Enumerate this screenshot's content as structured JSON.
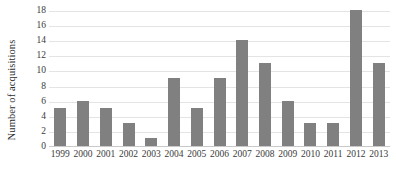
{
  "chart_data": {
    "type": "bar",
    "title": "",
    "subtitle": "",
    "xlabel": "",
    "ylabel": "Number of acquisitions",
    "categories": [
      "1999",
      "2000",
      "2001",
      "2002",
      "2003",
      "2004",
      "2005",
      "2006",
      "2007",
      "2008",
      "2009",
      "2010",
      "2011",
      "2012",
      "2013"
    ],
    "values": [
      5,
      6,
      5,
      3,
      1,
      9,
      5,
      9,
      14,
      11,
      6,
      3,
      3,
      18,
      11
    ],
    "ylim": [
      0,
      18
    ],
    "ytick_step": 2,
    "yticks": [
      "0",
      "2",
      "4",
      "6",
      "8",
      "10",
      "12",
      "14",
      "16",
      "18"
    ],
    "grid": true,
    "grid_axis": "y",
    "legend": false,
    "legend_position": "none",
    "bar_color": "#808080",
    "gridline_color": "#e4e4e4",
    "axis_color": "#c9c9c9",
    "text_color": "#3a3a3a",
    "background_color": "#ffffff"
  }
}
